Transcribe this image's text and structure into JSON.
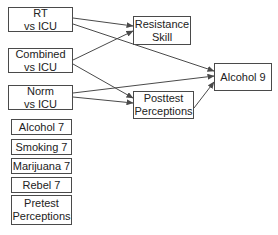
{
  "diagram": {
    "nodes": [
      {
        "id": "rt",
        "label": "RT\nvs ICU",
        "x": 8,
        "y": 7,
        "w": 65,
        "h": 25
      },
      {
        "id": "combined",
        "label": "Combined\nvs ICU",
        "x": 8,
        "y": 48,
        "w": 65,
        "h": 25
      },
      {
        "id": "norm",
        "label": "Norm\nvs ICU",
        "x": 8,
        "y": 85,
        "w": 65,
        "h": 25
      },
      {
        "id": "alcohol7",
        "label": "Alcohol 7",
        "x": 11,
        "y": 119,
        "w": 61,
        "h": 16
      },
      {
        "id": "smoking7",
        "label": "Smoking 7",
        "x": 11,
        "y": 139,
        "w": 61,
        "h": 16
      },
      {
        "id": "marijuana7",
        "label": "Marijuana 7",
        "x": 11,
        "y": 158,
        "w": 61,
        "h": 16
      },
      {
        "id": "rebel7",
        "label": "Rebel 7",
        "x": 11,
        "y": 177,
        "w": 61,
        "h": 16
      },
      {
        "id": "pretest",
        "label": "Pretest\nPerceptions",
        "x": 11,
        "y": 195,
        "w": 61,
        "h": 30
      },
      {
        "id": "resistance",
        "label": "Resistance\nSkill",
        "x": 133,
        "y": 16,
        "w": 58,
        "h": 29
      },
      {
        "id": "posttest",
        "label": "Posttest\nPerceptions",
        "x": 133,
        "y": 91,
        "w": 61,
        "h": 28
      },
      {
        "id": "alcohol9",
        "label": "Alcohol 9",
        "x": 214,
        "y": 63,
        "w": 58,
        "h": 28
      }
    ],
    "edges": [
      {
        "from": "rt",
        "to": "resistance",
        "x1": 73,
        "y1": 18,
        "x2": 133,
        "y2": 26
      },
      {
        "from": "rt",
        "to": "alcohol9",
        "x1": 73,
        "y1": 24,
        "x2": 214,
        "y2": 71
      },
      {
        "from": "combined",
        "to": "resistance",
        "x1": 73,
        "y1": 60,
        "x2": 133,
        "y2": 31
      },
      {
        "from": "combined",
        "to": "posttest",
        "x1": 73,
        "y1": 64,
        "x2": 133,
        "y2": 98
      },
      {
        "from": "norm",
        "to": "alcohol9",
        "x1": 73,
        "y1": 93,
        "x2": 214,
        "y2": 76
      },
      {
        "from": "norm",
        "to": "posttest",
        "x1": 73,
        "y1": 97,
        "x2": 133,
        "y2": 103
      },
      {
        "from": "posttest",
        "to": "alcohol9",
        "x1": 194,
        "y1": 108,
        "x2": 214,
        "y2": 82
      }
    ],
    "colors": {
      "line": "#4a4a4a",
      "border": "#4a4a4a",
      "background": "#ffffff"
    }
  }
}
